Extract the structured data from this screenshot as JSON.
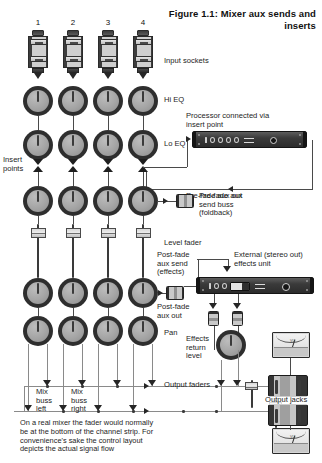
{
  "figure": {
    "title": "Figure 1.1: Mixer aux\nsends and inserts",
    "caption": "On a real mixer the fader would normally\nbe at the bottom of the channel strip. For\nconvenience's sake the control layout\ndepicts the actual signal flow"
  },
  "channels": {
    "numbers": [
      "1",
      "2",
      "3",
      "4"
    ]
  },
  "labels": {
    "input_sockets": "Input sockets",
    "hi_eq": "Hi EQ",
    "lo_eq": "Lo EQ",
    "insert_points": "Insert\npoints",
    "processor": "Processor connected via\ninsert point",
    "pre_fade_aux_out": "Pre-fade aux out",
    "pre_fade_aux_send_buss": "Pre-fade aux\nsend buss\n(foldback)",
    "level_fader": "Level fader",
    "post_fade_aux_send": "Post-fade\naux send\n(effects)",
    "post_fade_aux_out": "Post-fade\naux out",
    "external_effects_unit": "External (stereo out)\neffects unit",
    "pan": "Pan",
    "effects_return_level": "Effects\nreturn\nlevel",
    "output_faders": "Output faders",
    "mix_buss_left": "Mix\nbuss\nleft",
    "mix_buss_right": "Mix\nbuss\nright",
    "output_jacks": "Output jacks"
  },
  "devices": {
    "processor_display": "IOOOO",
    "effects_display": "IOO",
    "vu_text": "VU"
  },
  "colors": {
    "background": "#ffffff",
    "ink": "#1d1d1d",
    "wire": "#8a8a8a",
    "wire_dark": "#4a4a4a",
    "knob_ring": "#2e2e2e",
    "knob_face": "#a5a5a5",
    "rack_body": "#3a3a3a"
  }
}
